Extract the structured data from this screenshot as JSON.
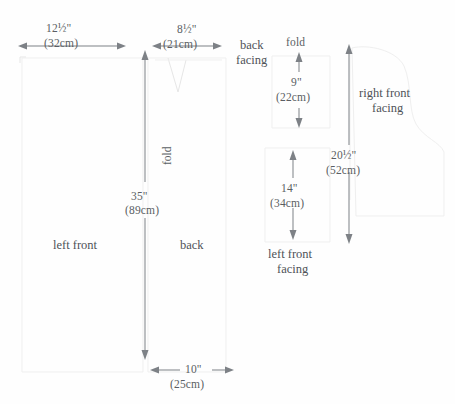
{
  "diagram": {
    "units": {
      "imperial_symbol": "\"",
      "metric_label": "cm"
    },
    "colors": {
      "background": "#fefefe",
      "text": "#55595e",
      "dimension_line": "#7d8186",
      "pattern_outline": "#e6e6e6"
    }
  },
  "dimensions": [
    {
      "id": "front-width",
      "imperial": "12½\"",
      "metric": "(32cm)",
      "orientation": "horizontal"
    },
    {
      "id": "back-width",
      "imperial": "8½\"",
      "metric": "(21cm)",
      "orientation": "horizontal"
    },
    {
      "id": "body-length",
      "imperial": "35\"",
      "metric": "(89cm)",
      "orientation": "vertical"
    },
    {
      "id": "hem-width",
      "imperial": "10\"",
      "metric": "(25cm)",
      "orientation": "horizontal"
    },
    {
      "id": "back-facing-height",
      "imperial": "9\"",
      "metric": "(22cm)",
      "orientation": "vertical"
    },
    {
      "id": "left-front-facing-height",
      "imperial": "14\"",
      "metric": "(34cm)",
      "orientation": "vertical"
    },
    {
      "id": "right-front-facing-height",
      "imperial": "20½\"",
      "metric": "(52cm)",
      "orientation": "vertical"
    }
  ],
  "pieces": [
    {
      "id": "left-front",
      "label": "left front"
    },
    {
      "id": "back",
      "label": "back"
    },
    {
      "id": "back-facing",
      "label_line1": "back",
      "label_line2": "facing"
    },
    {
      "id": "left-front-facing",
      "label_line1": "left front",
      "label_line2": "facing"
    },
    {
      "id": "right-front-facing",
      "label_line1": "right front",
      "label_line2": "facing"
    }
  ],
  "markers": [
    {
      "id": "fold-center",
      "label": "fold",
      "orientation": "vertical"
    },
    {
      "id": "fold-back-facing",
      "label": "fold",
      "orientation": "horizontal"
    }
  ]
}
